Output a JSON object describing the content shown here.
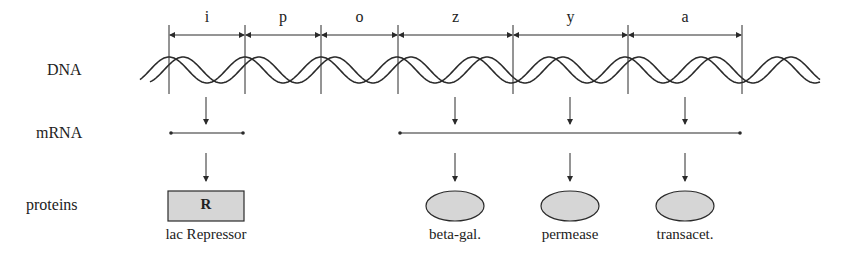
{
  "row_labels": {
    "dna": "DNA",
    "mrna": "mRNA",
    "proteins": "proteins"
  },
  "genes": [
    {
      "id": "i",
      "label": "i",
      "x_start": 169,
      "x_end": 245
    },
    {
      "id": "p",
      "label": "p",
      "x_start": 245,
      "x_end": 321
    },
    {
      "id": "o",
      "label": "o",
      "x_start": 321,
      "x_end": 398
    },
    {
      "id": "z",
      "label": "z",
      "x_start": 398,
      "x_end": 513
    },
    {
      "id": "y",
      "label": "y",
      "x_start": 513,
      "x_end": 628
    },
    {
      "id": "a",
      "label": "a",
      "x_start": 628,
      "x_end": 742
    }
  ],
  "mrna": [
    {
      "id": "repressor-mrna",
      "x_start": 171,
      "x_end": 243
    },
    {
      "id": "lac-operon-mrna",
      "x_start": 400,
      "x_end": 740
    }
  ],
  "proteins": [
    {
      "id": "lac-repressor",
      "label": "lac Repressor",
      "shape": "rect",
      "letter": "R",
      "x": 206
    },
    {
      "id": "beta-gal",
      "label": "beta-gal.",
      "shape": "ellipse",
      "x": 455
    },
    {
      "id": "permease",
      "label": "permease",
      "shape": "ellipse",
      "x": 570
    },
    {
      "id": "transacet",
      "label": "transacet.",
      "shape": "ellipse",
      "x": 685
    }
  ],
  "colors": {
    "line": "#2a2a2a",
    "protein_fill": "#d6d6d6",
    "background": "#ffffff"
  }
}
